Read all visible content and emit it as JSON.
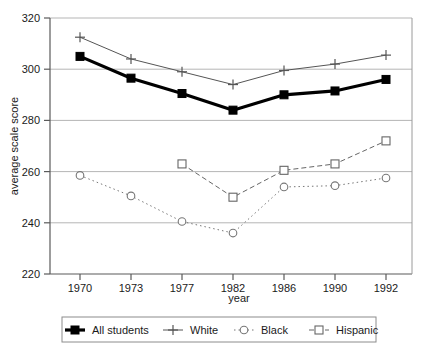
{
  "chart_data": {
    "type": "line",
    "title": "",
    "xlabel": "year",
    "ylabel": "average scale score",
    "categories": [
      "1970",
      "1973",
      "1977",
      "1982",
      "1986",
      "1990",
      "1992"
    ],
    "x": [
      1970,
      1973,
      1977,
      1982,
      1986,
      1990,
      1992
    ],
    "ylim": [
      220,
      320
    ],
    "yticks": [
      "220",
      "240",
      "260",
      "280",
      "300",
      "320"
    ],
    "ytick_values": [
      220,
      240,
      260,
      280,
      300,
      320
    ],
    "grid": "horizontal",
    "legend_position": "bottom",
    "series": [
      {
        "name": "All students",
        "marker": "filled-square",
        "line_style": "solid-thick",
        "color": "#000000",
        "values": [
          305,
          296.5,
          290.5,
          284,
          290,
          291.5,
          296
        ]
      },
      {
        "name": "White",
        "marker": "plus",
        "line_style": "solid-thin",
        "color": "#555555",
        "values": [
          312.5,
          304,
          299,
          294,
          299.5,
          302,
          305.5
        ]
      },
      {
        "name": "Black",
        "marker": "open-circle",
        "line_style": "dotted",
        "color": "#777777",
        "values": [
          258.5,
          250.5,
          240.5,
          236,
          254,
          254.5,
          257.5
        ]
      },
      {
        "name": "Hispanic",
        "marker": "open-square",
        "line_style": "dashed",
        "color": "#666666",
        "values": [
          null,
          null,
          263,
          250,
          260.5,
          263,
          272
        ]
      }
    ]
  },
  "legend": {
    "items": [
      {
        "label": "All students"
      },
      {
        "label": "White"
      },
      {
        "label": "Black"
      },
      {
        "label": "Hispanic"
      }
    ]
  }
}
